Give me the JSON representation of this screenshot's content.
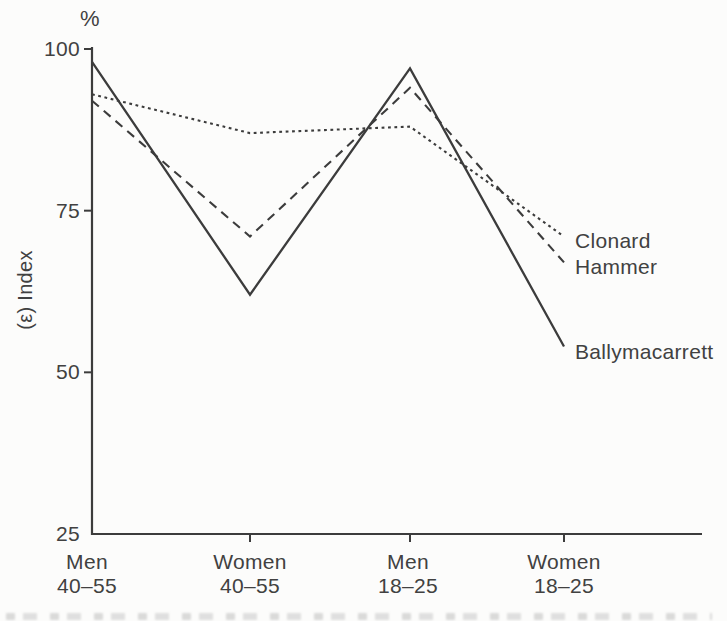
{
  "figure": {
    "background": "#fcfcfb",
    "line_color": "#3c3c3c",
    "text_color": "#414141"
  },
  "chart_data": {
    "type": "line",
    "title": "",
    "ylabel": "(ε) Index",
    "y_unit_label": "%",
    "xlabel": "",
    "ylim": [
      25,
      100
    ],
    "y_ticks": [
      100,
      75,
      50,
      25
    ],
    "grid": false,
    "legend_position": "right-of-line-ends",
    "categories": [
      {
        "group": "Men",
        "age": "40–55"
      },
      {
        "group": "Women",
        "age": "40–55"
      },
      {
        "group": "Men",
        "age": "18–25"
      },
      {
        "group": "Women",
        "age": "18–25"
      }
    ],
    "series": [
      {
        "name": "Clonard",
        "line_style": "dotted",
        "values": [
          93,
          87,
          88,
          71
        ]
      },
      {
        "name": "Hammer",
        "line_style": "dashed",
        "values": [
          92,
          71,
          94,
          67
        ]
      },
      {
        "name": "Ballymacarrett",
        "line_style": "solid",
        "values": [
          98,
          62,
          97,
          54
        ]
      }
    ]
  }
}
